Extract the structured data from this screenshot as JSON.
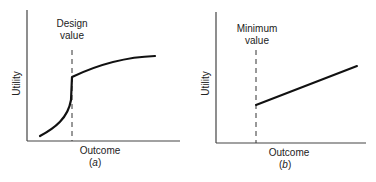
{
  "panels": [
    {
      "id": "a",
      "y_label": "Utility",
      "x_label": "Outcome",
      "caption_open": "(",
      "caption_letter": "a",
      "caption_close": ")",
      "marker_label_line1": "Design",
      "marker_label_line2": "value",
      "curve_description": "Convex rising curve below design value, jump at design value, then concave saturating curve above it"
    },
    {
      "id": "b",
      "y_label": "Utility",
      "x_label": "Outcome",
      "caption_open": "(",
      "caption_letter": "b",
      "caption_close": ")",
      "marker_label_line1": "Minimum",
      "marker_label_line2": "value",
      "curve_description": "Zero utility below minimum value, then linear increasing utility above it"
    }
  ],
  "colors": {
    "line": "#111111",
    "axis": "#333333",
    "text": "#222222",
    "background": "#ffffff"
  }
}
